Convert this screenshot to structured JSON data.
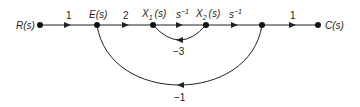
{
  "diagram": {
    "type": "signal-flow-graph",
    "nodes": [
      {
        "id": "R",
        "label": "R(s)"
      },
      {
        "id": "E",
        "label": "E(s)"
      },
      {
        "id": "X1",
        "label": "X1(s)",
        "base": "X",
        "sub": "1",
        "arg": "(s)"
      },
      {
        "id": "X2",
        "label": "X2(s)",
        "base": "X",
        "sub": "2",
        "arg": "(s)"
      },
      {
        "id": "N",
        "label": ""
      },
      {
        "id": "C",
        "label": "C(s)"
      }
    ],
    "branches": [
      {
        "from": "R",
        "to": "E",
        "gain": "1"
      },
      {
        "from": "E",
        "to": "X1",
        "gain": "2"
      },
      {
        "from": "X1",
        "to": "X2",
        "gain": "s^-1",
        "gain_base": "s",
        "gain_exp": "−1"
      },
      {
        "from": "X2",
        "to": "N",
        "gain": "s^-1",
        "gain_base": "s",
        "gain_exp": "−1"
      },
      {
        "from": "N",
        "to": "C",
        "gain": "1"
      },
      {
        "from": "X2",
        "to": "X1",
        "gain": "−3",
        "kind": "local feedback loop"
      },
      {
        "from": "N",
        "to": "E",
        "gain": "−1",
        "kind": "outer feedback loop"
      }
    ]
  }
}
